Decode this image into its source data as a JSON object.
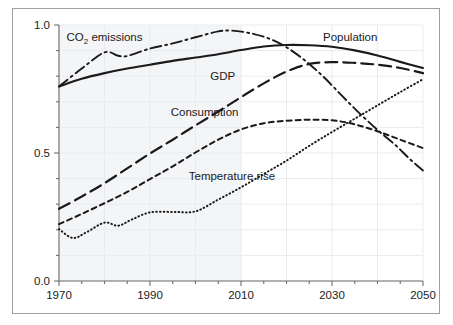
{
  "chart_data": {
    "type": "line",
    "title": "",
    "xlabel": "",
    "ylabel": "",
    "xlim": [
      1970,
      2050
    ],
    "ylim": [
      0.0,
      1.0
    ],
    "grid": true,
    "legend_position": "inline-labels",
    "x_ticks_major": [
      1970,
      1990,
      2010,
      2030,
      2050
    ],
    "x_tick_labels": [
      "1970",
      "1990",
      "2010",
      "2030",
      "2050"
    ],
    "x_ticks_minor_step": 5,
    "y_ticks_major": [
      0.0,
      0.5,
      1.0
    ],
    "y_tick_labels": [
      "0.0",
      "0.5",
      "1.0"
    ],
    "y_ticks_minor_step": 0.1,
    "history_shading_until": 2010,
    "series": [
      {
        "name": "Population",
        "label": "Population",
        "style": "solid",
        "label_x": 2034,
        "label_y": 0.955,
        "x": [
          1970,
          1975,
          1980,
          1985,
          1990,
          1995,
          2000,
          2005,
          2010,
          2015,
          2020,
          2025,
          2030,
          2035,
          2040,
          2045,
          2050
        ],
        "y": [
          0.76,
          0.79,
          0.812,
          0.83,
          0.845,
          0.86,
          0.873,
          0.886,
          0.902,
          0.916,
          0.922,
          0.921,
          0.915,
          0.901,
          0.881,
          0.856,
          0.832
        ]
      },
      {
        "name": "CO2 emissions",
        "label": "CO₂ emissions",
        "style": "dashdot",
        "label_x": 1980,
        "label_y": 0.952,
        "x": [
          1970,
          1975,
          1980,
          1983,
          1985,
          1990,
          1995,
          2000,
          2005,
          2008,
          2012,
          2016,
          2020,
          2024,
          2028,
          2032,
          2036,
          2040,
          2044,
          2047,
          2050
        ],
        "y": [
          0.76,
          0.83,
          0.893,
          0.88,
          0.879,
          0.908,
          0.928,
          0.952,
          0.975,
          0.978,
          0.968,
          0.948,
          0.913,
          0.862,
          0.8,
          0.727,
          0.656,
          0.59,
          0.53,
          0.478,
          0.432
        ]
      },
      {
        "name": "GDP",
        "label": "GDP",
        "style": "longdash",
        "label_x": 2006,
        "label_y": 0.8,
        "x": [
          1970,
          1975,
          1980,
          1985,
          1990,
          1995,
          2000,
          2005,
          2010,
          2015,
          2020,
          2025,
          2030,
          2035,
          2040,
          2045,
          2050
        ],
        "y": [
          0.282,
          0.33,
          0.382,
          0.44,
          0.498,
          0.552,
          0.608,
          0.662,
          0.718,
          0.772,
          0.818,
          0.848,
          0.855,
          0.852,
          0.845,
          0.832,
          0.812
        ]
      },
      {
        "name": "Consumption",
        "label": "Consumption",
        "style": "shortdash",
        "label_x": 2002,
        "label_y": 0.66,
        "x": [
          1970,
          1975,
          1980,
          1985,
          1990,
          1995,
          2000,
          2005,
          2010,
          2015,
          2020,
          2025,
          2030,
          2035,
          2040,
          2045,
          2050
        ],
        "y": [
          0.222,
          0.262,
          0.304,
          0.348,
          0.398,
          0.448,
          0.502,
          0.552,
          0.592,
          0.616,
          0.626,
          0.63,
          0.628,
          0.612,
          0.585,
          0.552,
          0.519
        ]
      },
      {
        "name": "Temperature rise",
        "label": "Temperature rise",
        "style": "dotted",
        "label_x": 2008,
        "label_y": 0.412,
        "x": [
          1970,
          1973,
          1976,
          1980,
          1983,
          1986,
          1990,
          1995,
          2000,
          2005,
          2010,
          2015,
          2020,
          2025,
          2030,
          2035,
          2040,
          2045,
          2050
        ],
        "y": [
          0.203,
          0.168,
          0.19,
          0.228,
          0.216,
          0.24,
          0.268,
          0.27,
          0.272,
          0.318,
          0.366,
          0.418,
          0.47,
          0.528,
          0.582,
          0.634,
          0.686,
          0.738,
          0.788
        ]
      }
    ]
  },
  "colors": {
    "ink": "#1a1a1a",
    "axis": "#6e6e6e",
    "grid": "#e9ebee",
    "shade": "#f4f5f7",
    "frame": "#9aa0a6",
    "background": "#ffffff"
  }
}
